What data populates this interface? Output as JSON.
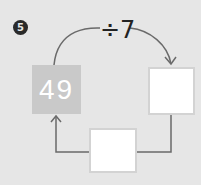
{
  "problem": {
    "number": "5",
    "operation": "÷7",
    "start_value": "49",
    "answer_boxes": [
      "",
      ""
    ]
  }
}
